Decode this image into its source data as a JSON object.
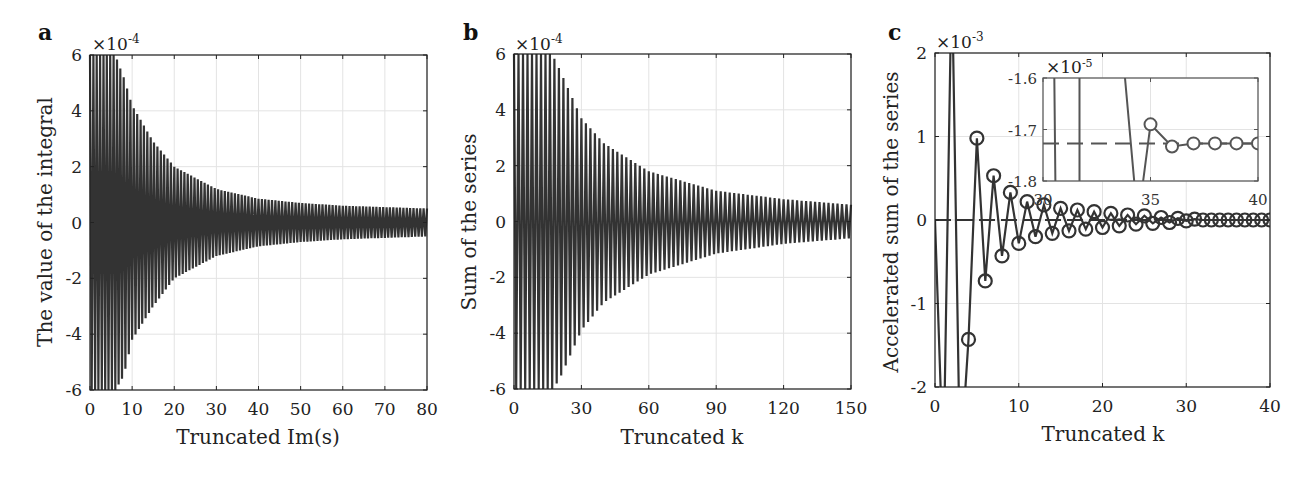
{
  "figure": {
    "colors": {
      "line": "#333333",
      "grid": "#e3e3e3",
      "frame": "#222222",
      "background": "#ffffff"
    }
  },
  "chart_data": [
    {
      "panel": "a",
      "type": "line",
      "title": "",
      "xlabel": "Truncated Im(s)",
      "ylabel": "The value of the integral",
      "y_multiplier": "×10^-4",
      "xlim": [
        0,
        80
      ],
      "ylim": [
        -6,
        6
      ],
      "x_ticks": [
        "0",
        "10",
        "20",
        "30",
        "40",
        "50",
        "60",
        "70",
        "80"
      ],
      "y_ticks": [
        "-6",
        "-4",
        "-2",
        "0",
        "2",
        "4",
        "6"
      ],
      "grid": true,
      "description": "Densely oscillating curve, alternating sign, envelope decaying from beyond ±6e-4 near 0 to about ±0.5e-4 at 80",
      "envelope": {
        "x": [
          0,
          6,
          8,
          10,
          15,
          20,
          30,
          40,
          50,
          60,
          70,
          80
        ],
        "upper": [
          6,
          6,
          5.2,
          4.2,
          2.9,
          2.0,
          1.2,
          0.85,
          0.7,
          0.6,
          0.55,
          0.5
        ],
        "lower": [
          -6,
          -6,
          -5.5,
          -4.2,
          -3.0,
          -2.0,
          -1.2,
          -0.85,
          -0.7,
          -0.6,
          -0.55,
          -0.5
        ]
      },
      "oscillations": 100
    },
    {
      "panel": "b",
      "type": "line",
      "title": "",
      "xlabel": "Truncated k",
      "ylabel": "Sum of the series",
      "y_multiplier": "×10^-4",
      "xlim": [
        0,
        150
      ],
      "ylim": [
        -6,
        6
      ],
      "x_ticks": [
        "0",
        "30",
        "60",
        "90",
        "120",
        "150"
      ],
      "y_ticks": [
        "-6",
        "-4",
        "-2",
        "0",
        "2",
        "4",
        "6"
      ],
      "grid": true,
      "description": "Partial sums oscillating in sign, envelope decaying from beyond ±6e-4 to about ±0.6e-4 at k=150",
      "envelope": {
        "x": [
          0,
          17,
          20,
          30,
          40,
          60,
          90,
          120,
          150
        ],
        "upper": [
          6,
          6,
          5.5,
          3.7,
          2.8,
          1.8,
          1.1,
          0.8,
          0.6
        ],
        "lower": [
          -6,
          -6,
          -5.7,
          -3.9,
          -2.9,
          -1.9,
          -1.15,
          -0.8,
          -0.6
        ]
      },
      "oscillations": 75
    },
    {
      "panel": "c",
      "type": "line",
      "title": "",
      "xlabel": "Truncated k",
      "ylabel": "Accelerated sum of the series",
      "y_multiplier": "×10^-3",
      "xlim": [
        0,
        40
      ],
      "ylim": [
        -2,
        2
      ],
      "x_ticks": [
        "0",
        "10",
        "20",
        "30",
        "40"
      ],
      "y_ticks": [
        "-2",
        "-1",
        "0",
        "1",
        "2"
      ],
      "grid": true,
      "markers": "open circles",
      "limit_line": 0,
      "x": [
        1,
        2,
        3,
        4,
        5,
        6,
        7,
        8,
        9,
        10,
        11,
        12,
        13,
        14,
        15,
        16,
        17,
        18,
        19,
        20,
        21,
        22,
        23,
        24,
        25,
        26,
        27,
        28,
        29,
        30,
        31,
        32,
        33,
        34,
        35,
        36,
        37,
        38,
        39,
        40
      ],
      "y": [
        -3.0,
        3.0,
        -3.0,
        -1.43,
        0.98,
        -0.73,
        0.53,
        -0.43,
        0.33,
        -0.28,
        0.22,
        -0.2,
        0.18,
        -0.16,
        0.14,
        -0.13,
        0.12,
        -0.11,
        0.1,
        -0.09,
        0.08,
        -0.07,
        0.06,
        -0.05,
        0.05,
        -0.04,
        0.03,
        -0.03,
        0.02,
        -0.01,
        0.01,
        0.0,
        0.0,
        0.0,
        0.0,
        0.0,
        0.0,
        0.0,
        0.0,
        0.0
      ],
      "inset": {
        "y_multiplier": "×10^-5",
        "xlim": [
          30,
          40
        ],
        "ylim": [
          -1.8,
          -1.6
        ],
        "x_ticks": [
          "30",
          "35",
          "40"
        ],
        "y_ticks": [
          "-1.6",
          "-1.7",
          "-1.8"
        ],
        "limit_line": -1.727,
        "x": [
          35,
          36,
          37,
          38,
          39,
          40
        ],
        "y": [
          -1.69,
          -1.733,
          -1.727,
          -1.727,
          -1.727,
          -1.727
        ]
      }
    }
  ],
  "panels": {
    "a": {
      "letter": "a",
      "multiplier_base": "×10",
      "multiplier_exp": "-4",
      "xlabel": "Truncated Im(s)",
      "ylabel": "The value of the integral",
      "xticks": [
        "0",
        "10",
        "20",
        "30",
        "40",
        "50",
        "60",
        "70",
        "80"
      ],
      "yticks": [
        "6",
        "4",
        "2",
        "0",
        "-2",
        "-4",
        "-6"
      ]
    },
    "b": {
      "letter": "b",
      "multiplier_base": "×10",
      "multiplier_exp": "-4",
      "xlabel": "Truncated k",
      "ylabel": "Sum of the series",
      "xticks": [
        "0",
        "30",
        "60",
        "90",
        "120",
        "150"
      ],
      "yticks": [
        "6",
        "4",
        "2",
        "0",
        "-2",
        "-4",
        "-6"
      ]
    },
    "c": {
      "letter": "c",
      "multiplier_base": "×10",
      "multiplier_exp": "-3",
      "xlabel": "Truncated k",
      "ylabel": "Accelerated sum of the series",
      "xticks": [
        "0",
        "10",
        "20",
        "30",
        "40"
      ],
      "yticks": [
        "2",
        "1",
        "0",
        "-1",
        "-2"
      ],
      "inset": {
        "multiplier_base": "×10",
        "multiplier_exp": "-5",
        "xticks": [
          "30",
          "35",
          "40"
        ],
        "yticks": [
          "-1.6",
          "-1.7",
          "-1.8"
        ]
      }
    }
  }
}
